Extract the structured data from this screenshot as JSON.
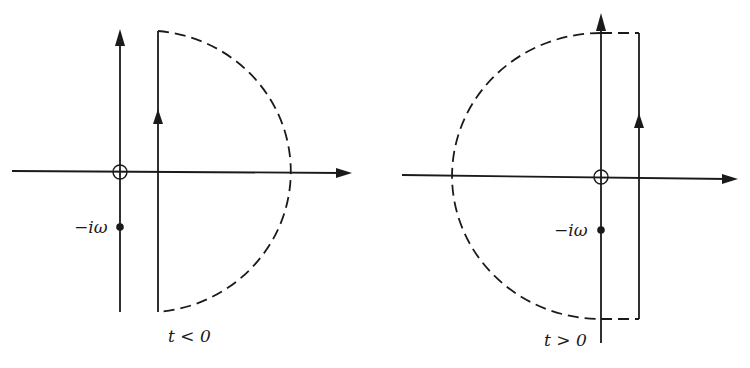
{
  "figure": {
    "colors": {
      "ink": "#1a1a1a",
      "background": "#ffffff"
    },
    "panels": [
      {
        "id": "left",
        "caption": "t < 0",
        "pole_label": "−iω",
        "contour_closure": "right half-plane (dashed semicircle)",
        "arrow_direction": "up"
      },
      {
        "id": "right",
        "caption": "t > 0",
        "pole_label": "−iω",
        "contour_closure": "left half-plane (dashed semicircle)",
        "arrow_direction": "up"
      }
    ]
  }
}
